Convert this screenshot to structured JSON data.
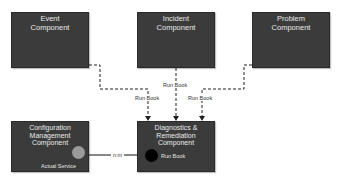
{
  "diagram": {
    "components": [
      {
        "id": "event",
        "title": "Event\nComponent"
      },
      {
        "id": "incident",
        "title": "Incident\nComponent"
      },
      {
        "id": "problem",
        "title": "Problem\nComponent"
      },
      {
        "id": "configuration",
        "title": "Configuration\nManagement\nComponent",
        "port_label": "Actual Service"
      },
      {
        "id": "diagnostics",
        "title": "Diagnostics &\nRemediation\nComponent",
        "port_label": "Run Book"
      }
    ],
    "connectors": [
      {
        "from": "event",
        "to": "diagnostics",
        "style": "dashed",
        "label": "Run Book"
      },
      {
        "from": "incident",
        "to": "diagnostics",
        "style": "dashed",
        "label": "Run Book"
      },
      {
        "from": "problem",
        "to": "diagnostics",
        "style": "dashed",
        "label": "Run Book"
      },
      {
        "from": "configuration",
        "to": "diagnostics",
        "style": "solid",
        "label": "n:m"
      }
    ],
    "colors": {
      "box_fill": "#3b3b3b",
      "box_text": "#eaeaea",
      "line": "#222222",
      "actual_service_port": "#9a9a9a",
      "run_book_port": "#000000"
    }
  }
}
